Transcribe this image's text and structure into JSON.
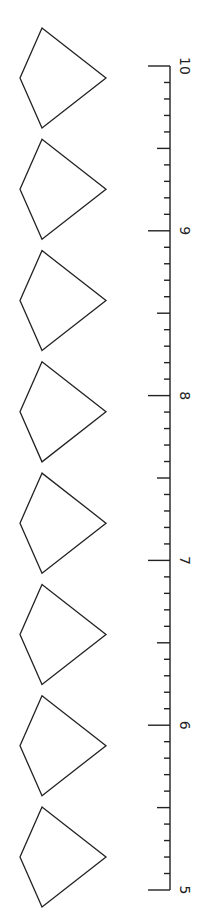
{
  "title": "",
  "ruler": {
    "min": 5,
    "max": 10,
    "labels": [
      "5",
      "6",
      "7",
      "8",
      "9",
      "10"
    ],
    "minor_divisions_per_unit": 10,
    "orientation": "vertical, rotated 90deg (labels read sideways)"
  },
  "shapes": {
    "type": "kite",
    "count": 8,
    "color": "#222222"
  },
  "colors": {
    "stroke": "#222222",
    "background": "#ffffff"
  }
}
